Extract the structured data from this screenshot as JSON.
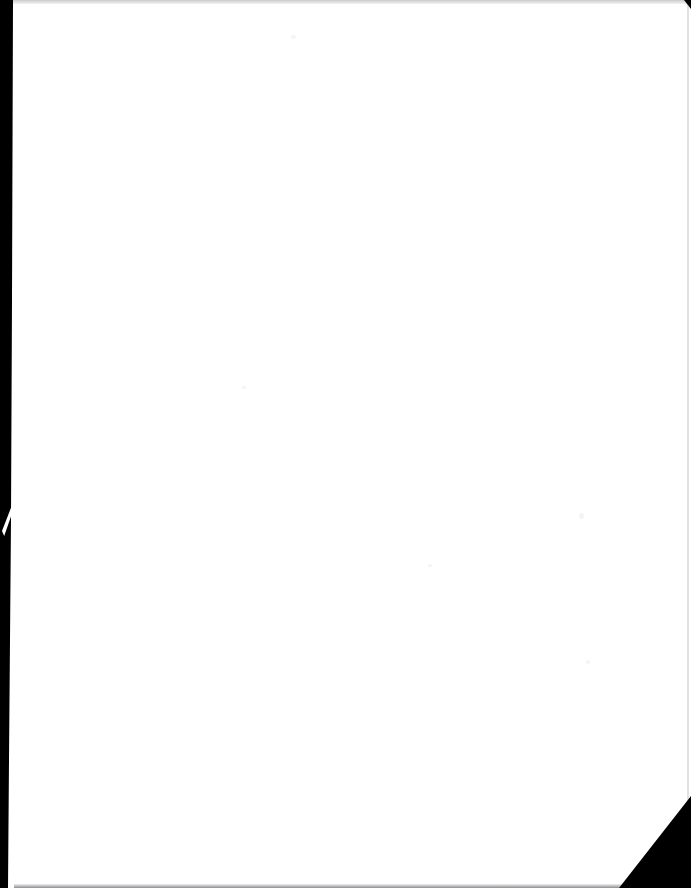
{
  "document": {
    "page_kind": "scanned-blank-page",
    "page_text": "",
    "blank_note": "",
    "visible_text_count": 0
  },
  "artifacts": {
    "gutter_band": {
      "name": "left-binding-shadow",
      "color": "#000000",
      "edge": "left"
    },
    "gutter_nick": {
      "name": "white-nick-in-gutter",
      "color": "#ffffff"
    },
    "top_edge_rule": {
      "name": "top-scan-edge",
      "color": "#c9c9cc",
      "edge": "top"
    },
    "right_edge_rule": {
      "name": "right-scan-edge",
      "color": "#e2e2e4",
      "edge": "right"
    },
    "bottom_edge_rule": {
      "name": "bottom-scan-edge",
      "color": "#8e8e92",
      "edge": "bottom"
    },
    "corner_notch_tr": {
      "name": "top-right-corner-notch",
      "color": "#000000"
    },
    "folded_corner": {
      "name": "bottom-right-folded-corner",
      "color": "#000000"
    },
    "specks": [
      {
        "name": "speck-a",
        "color": "#f4f4f6"
      },
      {
        "name": "speck-b",
        "color": "#f4f4f6"
      },
      {
        "name": "speck-c",
        "color": "#f4f4f6"
      },
      {
        "name": "speck-d",
        "color": "#f4f4f6"
      },
      {
        "name": "speck-e",
        "color": "#f4f4f6"
      }
    ]
  },
  "colors": {
    "paper": "#ffffff",
    "shadow": "#000000",
    "edge_grey": "#c9c9cc"
  }
}
